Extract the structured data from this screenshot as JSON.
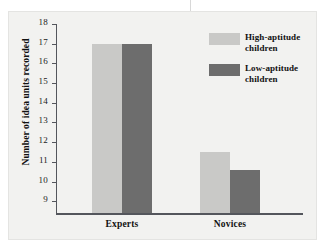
{
  "chart_data": {
    "type": "bar",
    "title": "",
    "xlabel": "",
    "ylabel": "Number of idea units recorded",
    "categories": [
      "Experts",
      "Novices"
    ],
    "series": [
      {
        "name": "High-aptitude children",
        "values": [
          17.0,
          11.5
        ],
        "color": "#c9c9c7"
      },
      {
        "name": "Low-aptitude children",
        "values": [
          17.0,
          10.6
        ],
        "color": "#6d6d6d"
      }
    ],
    "ylim": [
      8.4,
      18
    ],
    "yticks": [
      18,
      17,
      16,
      15,
      14,
      13,
      12,
      11,
      10,
      9
    ],
    "ytick_labels": [
      "18",
      "17",
      "16",
      "15",
      "14",
      "13",
      "12",
      "11",
      "10",
      "9"
    ],
    "grid": false,
    "legend_position": "top-right"
  },
  "figure": {
    "panel_color": "#f2f2f0",
    "axis_color": "#54565c",
    "background": "#ffffff"
  }
}
